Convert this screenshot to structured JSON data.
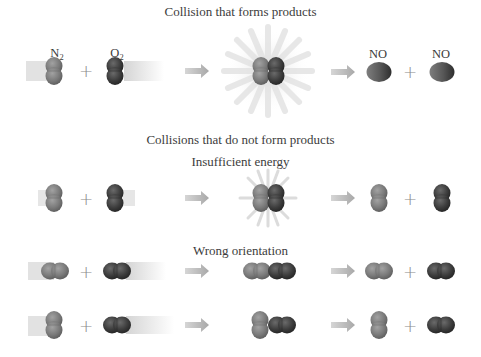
{
  "diagram": {
    "colors": {
      "n2_light": "#7d7d7d",
      "o2_dark": "#3f3f3f",
      "arrow": "#b4b4b4",
      "blur_trail": "#d6d6d6",
      "starburst": "#e4e4e4",
      "text": "#3c3c3c"
    },
    "sections": [
      {
        "heading": "Collision that forms products",
        "rows": [
          {
            "name": "successful-collision",
            "reactants": [
              {
                "label": "N",
                "subscript": "2",
                "shade": "light",
                "orientation": "vertical",
                "motion": "moving-right"
              },
              {
                "label": "O",
                "subscript": "2",
                "shade": "dark",
                "orientation": "vertical",
                "motion": "moving-left"
              }
            ],
            "operator": "+",
            "collision": {
              "arrangement": "side-by-side vertical pair",
              "starburst": "large"
            },
            "products": [
              {
                "label": "NO",
                "shade": "mixed"
              },
              {
                "label": "NO",
                "shade": "mixed"
              }
            ]
          }
        ]
      },
      {
        "heading": "Collisions that do not form products",
        "subsections": [
          {
            "subheading": "Insufficient energy",
            "rows": [
              {
                "name": "insufficient-energy",
                "reactants": [
                  {
                    "shade": "light",
                    "orientation": "vertical"
                  },
                  {
                    "shade": "dark",
                    "orientation": "vertical"
                  }
                ],
                "operator": "+",
                "collision": {
                  "arrangement": "side-by-side vertical pair",
                  "starburst": "small"
                },
                "products": [
                  {
                    "shade": "light",
                    "orientation": "vertical"
                  },
                  {
                    "shade": "dark",
                    "orientation": "vertical"
                  }
                ]
              }
            ]
          },
          {
            "subheading": "Wrong orientation",
            "rows": [
              {
                "name": "wrong-orientation-end-on",
                "reactants": [
                  {
                    "shade": "light",
                    "orientation": "horizontal"
                  },
                  {
                    "shade": "dark",
                    "orientation": "horizontal"
                  }
                ],
                "operator": "+",
                "collision": {
                  "arrangement": "end-to-end horizontal"
                },
                "products": [
                  {
                    "shade": "light",
                    "orientation": "horizontal"
                  },
                  {
                    "shade": "dark",
                    "orientation": "horizontal"
                  }
                ]
              },
              {
                "name": "wrong-orientation-t-shape",
                "reactants": [
                  {
                    "shade": "light",
                    "orientation": "vertical"
                  },
                  {
                    "shade": "dark",
                    "orientation": "horizontal"
                  }
                ],
                "operator": "+",
                "collision": {
                  "arrangement": "vertical meets horizontal"
                },
                "products": [
                  {
                    "shade": "light",
                    "orientation": "vertical"
                  },
                  {
                    "shade": "dark",
                    "orientation": "horizontal"
                  }
                ]
              }
            ]
          }
        ]
      }
    ],
    "text": {
      "heading_success": "Collision that forms products",
      "heading_fail": "Collisions that do not form products",
      "sub_energy": "Insufficient energy",
      "sub_orientation": "Wrong orientation",
      "n2_letter": "N",
      "n2_sub": "2",
      "o2_letter": "O",
      "o2_sub": "2",
      "product_label": "NO",
      "plus": "+"
    }
  }
}
